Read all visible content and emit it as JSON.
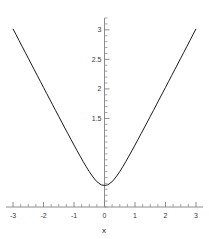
{
  "chart_data": {
    "type": "line",
    "title": "",
    "subtitle": "",
    "xlabel": "x",
    "ylabel": "",
    "xlim": [
      -3,
      3
    ],
    "ylim": [
      0,
      3.2
    ],
    "grid": false,
    "legend": null,
    "xticks": [
      -3,
      -2,
      -1,
      0,
      1,
      2,
      3
    ],
    "xtick_labels": [
      "-3",
      "-2",
      "-1",
      "0",
      "1",
      "2",
      "3"
    ],
    "yticks": [
      1.5,
      2,
      2.5,
      3
    ],
    "ytick_labels": [
      "1.5",
      "2",
      "2.5",
      "3"
    ],
    "x_minor_step": 0.25,
    "y_minor_step": 0.1,
    "series": [
      {
        "name": "curve",
        "color": "#000000",
        "x": [
          -3,
          -2.9,
          -2.8,
          -2.7,
          -2.6,
          -2.5,
          -2.4,
          -2.3,
          -2.2,
          -2.1,
          -2,
          -1.9,
          -1.8,
          -1.7,
          -1.6,
          -1.5,
          -1.4,
          -1.3,
          -1.2,
          -1.1,
          -1,
          -0.9,
          -0.8,
          -0.7,
          -0.6,
          -0.5,
          -0.4,
          -0.3,
          -0.2,
          -0.1,
          0,
          0.1,
          0.2,
          0.3,
          0.4,
          0.5,
          0.6,
          0.7,
          0.8,
          0.9,
          1,
          1.1,
          1.2,
          1.3,
          1.4,
          1.5,
          1.6,
          1.7,
          1.8,
          1.9,
          2,
          2.1,
          2.2,
          2.3,
          2.4,
          2.5,
          2.6,
          2.7,
          2.8,
          2.9,
          3
        ],
        "y": [
          3.017,
          2.917,
          2.818,
          2.718,
          2.619,
          2.52,
          2.421,
          2.322,
          2.223,
          2.124,
          2.025,
          1.926,
          1.828,
          1.729,
          1.631,
          1.533,
          1.435,
          1.338,
          1.241,
          1.145,
          1.049,
          0.954,
          0.862,
          0.77,
          0.682,
          0.6,
          0.524,
          0.458,
          0.406,
          0.374,
          0.365,
          0.374,
          0.406,
          0.458,
          0.524,
          0.6,
          0.682,
          0.77,
          0.862,
          0.954,
          1.049,
          1.145,
          1.241,
          1.338,
          1.435,
          1.533,
          1.631,
          1.729,
          1.828,
          1.926,
          2.025,
          2.124,
          2.223,
          2.322,
          2.421,
          2.52,
          2.619,
          2.718,
          2.818,
          2.917,
          3.017
        ]
      }
    ]
  },
  "axes": {
    "x_axis_name": "x-axis",
    "y_axis_name": "y-axis"
  }
}
